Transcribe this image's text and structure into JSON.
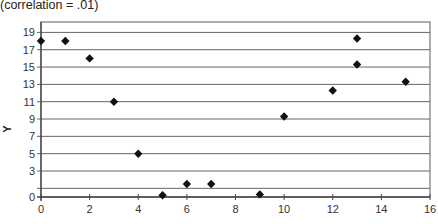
{
  "title": "(correlation = .01)",
  "chart_data": {
    "type": "scatter",
    "title": "(correlation = .01)",
    "xlabel": "",
    "ylabel": "Y",
    "xlim": [
      0,
      16
    ],
    "ylim": [
      0,
      20
    ],
    "x_ticks": [
      "0",
      "2",
      "4",
      "6",
      "8",
      "10",
      "12",
      "14",
      "16"
    ],
    "y_ticks": [
      "0",
      "3",
      "5",
      "7",
      "9",
      "11",
      "13",
      "15",
      "17",
      "19"
    ],
    "grid": "horizontal",
    "legend": "none",
    "marker": "diamond",
    "marker_color": "#111111",
    "series": [
      {
        "name": "points",
        "x": [
          0,
          1,
          2,
          3,
          4,
          5,
          6,
          7,
          9,
          10,
          12,
          13,
          13,
          15
        ],
        "y": [
          18,
          18,
          16,
          11,
          5,
          0.2,
          1.5,
          1.5,
          0.3,
          9.3,
          12.3,
          18.3,
          15.3,
          13.3
        ]
      }
    ]
  }
}
